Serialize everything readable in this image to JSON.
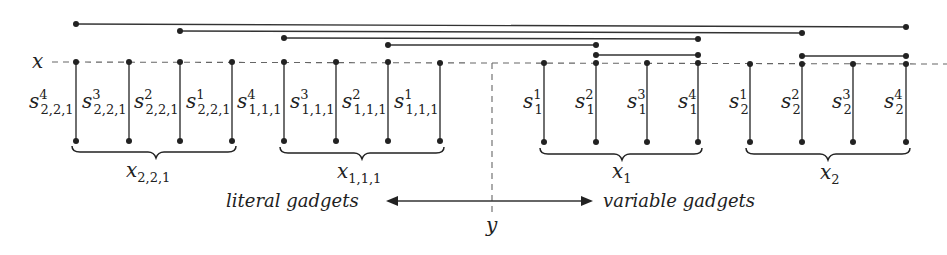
{
  "diagram": {
    "axis_labels": {
      "x": "x",
      "y": "y"
    },
    "colors": {
      "line": "#333333",
      "dashed": "#666666",
      "node": "#222222",
      "background": "#ffffff"
    },
    "literal_gadgets": [
      {
        "name": "x",
        "sub": "2,2,1",
        "segments": [
          {
            "base": "s",
            "sup": "4",
            "sub": "2,2,1"
          },
          {
            "base": "s",
            "sup": "3",
            "sub": "2,2,1"
          },
          {
            "base": "s",
            "sup": "2",
            "sub": "2,2,1"
          },
          {
            "base": "s",
            "sup": "1",
            "sub": "2,2,1"
          }
        ]
      },
      {
        "name": "x",
        "sub": "1,1,1",
        "segments": [
          {
            "base": "s",
            "sup": "4",
            "sub": "1,1,1"
          },
          {
            "base": "s",
            "sup": "3",
            "sub": "1,1,1"
          },
          {
            "base": "s",
            "sup": "2",
            "sub": "1,1,1"
          },
          {
            "base": "s",
            "sup": "1",
            "sub": "1,1,1"
          }
        ]
      }
    ],
    "variable_gadgets": [
      {
        "name": "x",
        "sub": "1",
        "segments": [
          {
            "base": "s",
            "sup": "1",
            "sub": "1"
          },
          {
            "base": "s",
            "sup": "2",
            "sub": "1"
          },
          {
            "base": "s",
            "sup": "3",
            "sub": "1"
          },
          {
            "base": "s",
            "sup": "4",
            "sub": "1"
          }
        ]
      },
      {
        "name": "x",
        "sub": "2",
        "segments": [
          {
            "base": "s",
            "sup": "1",
            "sub": "2"
          },
          {
            "base": "s",
            "sup": "2",
            "sub": "2"
          },
          {
            "base": "s",
            "sup": "3",
            "sub": "2"
          },
          {
            "base": "s",
            "sup": "4",
            "sub": "2"
          }
        ]
      }
    ],
    "arrow_labels": {
      "left": "literal gadgets",
      "right": "variable gadgets"
    }
  }
}
